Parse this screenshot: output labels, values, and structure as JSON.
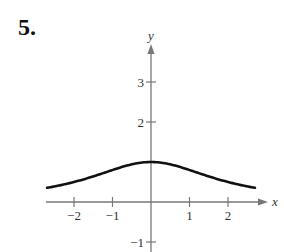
{
  "problem_number": "5.",
  "chart_data": {
    "type": "line",
    "title": "",
    "xlabel": "x",
    "ylabel": "y",
    "x_ticks": [
      -2,
      -1,
      1,
      2
    ],
    "x_tick_labels": [
      "−2",
      "−1",
      "1",
      "2"
    ],
    "y_ticks": [
      -1,
      2,
      3
    ],
    "y_tick_labels": [
      "−1",
      "2",
      "3"
    ],
    "xlim": [
      -2.7,
      2.7
    ],
    "ylim": [
      -1.2,
      4
    ],
    "grid": false,
    "legend": null,
    "series": [
      {
        "name": "curve",
        "description": "Bell-shaped curve symmetric about the y-axis, maximum 1 at x=0, decaying toward 0",
        "x": [
          -2.7,
          -2.5,
          -2,
          -1.5,
          -1,
          -0.5,
          0,
          0.5,
          1,
          1.5,
          2,
          2.5,
          2.7
        ],
        "y": [
          0.35,
          0.39,
          0.5,
          0.64,
          0.8,
          0.94,
          1.0,
          0.94,
          0.8,
          0.64,
          0.5,
          0.39,
          0.35
        ]
      }
    ],
    "colors": {
      "axis": "#777777",
      "curve": "#111111",
      "text": "#333333"
    }
  }
}
